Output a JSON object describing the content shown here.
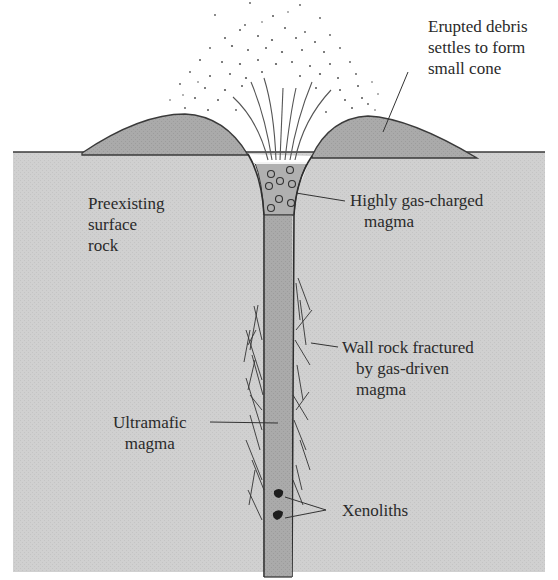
{
  "diagram": {
    "colors": {
      "background": "#ffffff",
      "ground": "#cfcfcf",
      "cone": "#a9a9a9",
      "conduit": "#a4a4a4",
      "gas_magma": "#b3b3b3",
      "outline": "#3a3a3a",
      "text": "#2a2a2a"
    },
    "labels": {
      "erupted_debris": [
        "Erupted debris",
        "settles to form",
        "small cone"
      ],
      "preexisting_rock": [
        "Preexisting",
        "surface",
        "rock"
      ],
      "gas_charged_magma": [
        "Highly gas-charged",
        "magma"
      ],
      "wall_rock": [
        "Wall rock fractured",
        "by gas-driven",
        "magma"
      ],
      "ultramafic_magma": [
        "Ultramafic",
        "magma"
      ],
      "xenoliths": "Xenoliths"
    }
  }
}
